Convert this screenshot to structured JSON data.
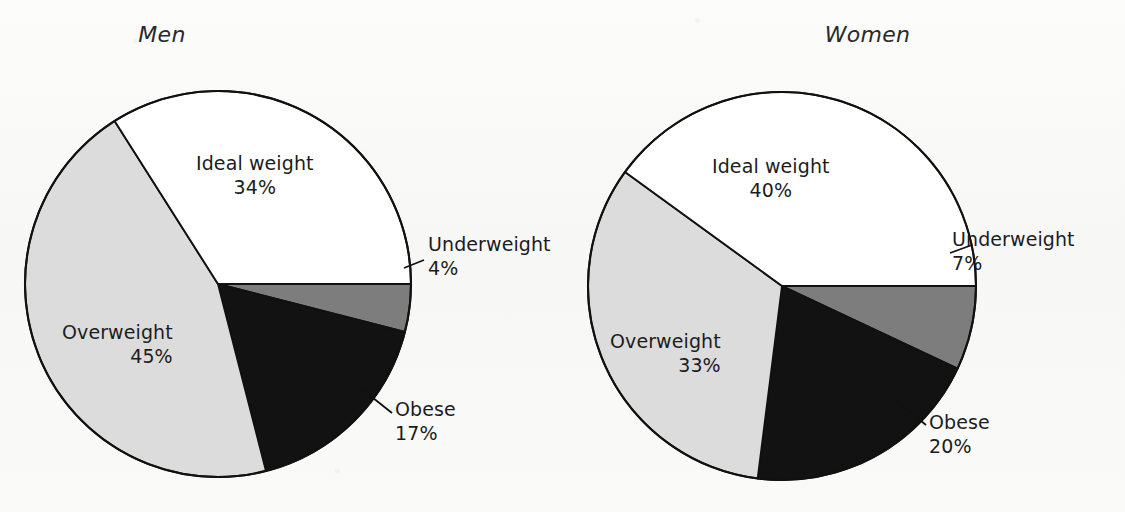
{
  "chart_data": [
    {
      "type": "pie",
      "title": "Men",
      "categories": [
        "Ideal weight",
        "Underweight",
        "Obese",
        "Overweight"
      ],
      "values": [
        34,
        4,
        17,
        45
      ],
      "unit": "%",
      "legend": "none",
      "slices": [
        {
          "label": "Ideal weight",
          "value": 34,
          "value_text": "34%",
          "color": "#ffffff",
          "name": "ideal-weight"
        },
        {
          "label": "Underweight",
          "value": 4,
          "value_text": "4%",
          "color": "#7d7d7d",
          "name": "underweight"
        },
        {
          "label": "Obese",
          "value": 17,
          "value_text": "17%",
          "color": "#121212",
          "name": "obese"
        },
        {
          "label": "Overweight",
          "value": 45,
          "value_text": "45%",
          "color": "#dcdcdc",
          "name": "overweight"
        }
      ]
    },
    {
      "type": "pie",
      "title": "Women",
      "categories": [
        "Ideal weight",
        "Underweight",
        "Obese",
        "Overweight"
      ],
      "values": [
        40,
        7,
        20,
        33
      ],
      "unit": "%",
      "legend": "none",
      "slices": [
        {
          "label": "Ideal weight",
          "value": 40,
          "value_text": "40%",
          "color": "#ffffff",
          "name": "ideal-weight"
        },
        {
          "label": "Underweight",
          "value": 7,
          "value_text": "7%",
          "color": "#7d7d7d",
          "name": "underweight"
        },
        {
          "label": "Obese",
          "value": 20,
          "value_text": "20%",
          "color": "#121212",
          "name": "obese"
        },
        {
          "label": "Overweight",
          "value": 33,
          "value_text": "33%",
          "color": "#dcdcdc",
          "name": "overweight"
        }
      ]
    }
  ],
  "men": {
    "title": "Men",
    "ideal_weight_label": "Ideal weight",
    "ideal_weight_pct": "34%",
    "underweight_label": "Underweight",
    "underweight_pct": "4%",
    "obese_label": "Obese",
    "obese_pct": "17%",
    "overweight_label": "Overweight",
    "overweight_pct": "45%"
  },
  "women": {
    "title": "Women",
    "ideal_weight_label": "Ideal weight",
    "ideal_weight_pct": "40%",
    "underweight_label": "Underweight",
    "underweight_pct": "7%",
    "obese_label": "Obese",
    "obese_pct": "20%",
    "overweight_label": "Overweight",
    "overweight_pct": "33%"
  },
  "colors": {
    "underweight": "#7d7d7d",
    "obese": "#121212",
    "overweight": "#dcdcdc",
    "ideal_weight": "#ffffff",
    "outline": "#111111",
    "background": "#fbfbfa"
  }
}
